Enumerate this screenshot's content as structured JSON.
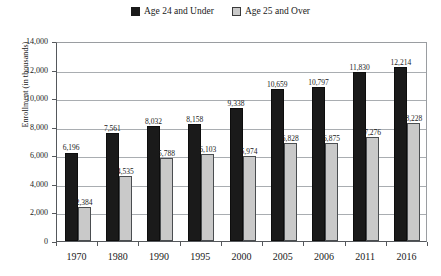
{
  "chart_data": {
    "type": "bar",
    "title": "",
    "xlabel": "",
    "ylabel": "Enrollment (in thousands)",
    "ylim": [
      0,
      14000
    ],
    "ytick_values": [
      0,
      2000,
      4000,
      6000,
      8000,
      10000,
      12000,
      14000
    ],
    "ytick_labels": [
      "0",
      "2,000",
      "4,000",
      "6,000",
      "8,000",
      "10,000",
      "12,000",
      "14,000"
    ],
    "grid": true,
    "legend_position": "top-center",
    "categories": [
      "1970",
      "1980",
      "1990",
      "1995",
      "2000",
      "2005",
      "2006",
      "2011",
      "2016"
    ],
    "series": [
      {
        "name": "Age 24 and Under",
        "color": "#1a1a1a",
        "values": [
          6196,
          7561,
          8032,
          8158,
          9338,
          10659,
          10797,
          11830,
          12214
        ],
        "labels": [
          "6,196",
          "7,561",
          "8,032",
          "8,158",
          "9,338",
          "10,659",
          "10,797",
          "11,830",
          "12,214"
        ]
      },
      {
        "name": "Age 25 and Over",
        "color": "#c9c9c9",
        "values": [
          2384,
          4535,
          5788,
          6103,
          5974,
          6828,
          6875,
          7276,
          8228
        ],
        "labels": [
          "2,384",
          "4,535",
          "5,788",
          "6,103",
          "5,974",
          "6,828",
          "6,875",
          "7,276",
          "8,228"
        ]
      }
    ]
  },
  "legend": {
    "items": [
      {
        "label": "Age 24 and Under",
        "swatch": "dark-square-icon"
      },
      {
        "label": "Age 25 and Over",
        "swatch": "light-square-icon"
      }
    ]
  },
  "axes": {
    "y_title": "Enrollment (in thousands)"
  }
}
